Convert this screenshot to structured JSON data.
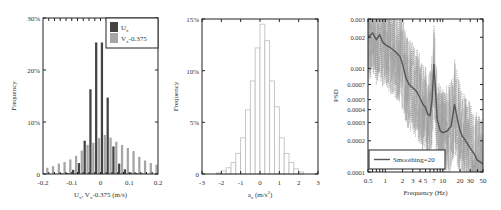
{
  "chart_data": [
    {
      "type": "bar",
      "title": "",
      "xlabel": "U_x, V_x-0.375 (m/s)",
      "ylabel": "Frequency",
      "xlim": [
        -0.2,
        0.2
      ],
      "ylim": [
        0,
        30
      ],
      "xticks": [
        "-0.2",
        "-0.1",
        "0",
        "0.1",
        "0.2"
      ],
      "yticks": [
        "0",
        "10%",
        "20%",
        "30%"
      ],
      "legend_position": "upper right",
      "bin_width": 0.02,
      "x": [
        -0.19,
        -0.17,
        -0.15,
        -0.13,
        -0.11,
        -0.09,
        -0.07,
        -0.05,
        -0.03,
        -0.01,
        0.01,
        0.03,
        0.05,
        0.07,
        0.09,
        0.11,
        0.13,
        0.15,
        0.17,
        0.19
      ],
      "series": [
        {
          "name": "U_x",
          "color": "#444444",
          "values": [
            0,
            0,
            0,
            0.1,
            0.2,
            0.8,
            2.1,
            6.4,
            16.3,
            25.3,
            25.3,
            14.7,
            5.3,
            2.0,
            0.9,
            0.3,
            0.2,
            0.1,
            0,
            0
          ]
        },
        {
          "name": "V_x-0.375",
          "color": "#a6a6a6",
          "values": [
            1.2,
            1.5,
            2.0,
            2.3,
            2.8,
            3.5,
            4.5,
            5.6,
            6.0,
            6.9,
            7.5,
            7.0,
            6.2,
            5.6,
            5.0,
            4.4,
            3.3,
            2.6,
            2.1,
            1.8
          ]
        }
      ]
    },
    {
      "type": "bar",
      "title": "",
      "xlabel": "a_x (m/s²)",
      "ylabel": "Frequency",
      "xlim": [
        -3,
        3
      ],
      "ylim": [
        0,
        15
      ],
      "xticks": [
        "-3",
        "-2",
        "-1",
        "0",
        "1",
        "2",
        "3"
      ],
      "yticks": [
        "0",
        "5%",
        "10%",
        "15%"
      ],
      "bin_width": 0.25,
      "x": [
        -2.125,
        -1.875,
        -1.625,
        -1.375,
        -1.125,
        -0.875,
        -0.625,
        -0.375,
        -0.125,
        0.125,
        0.375,
        0.625,
        0.875,
        1.125,
        1.375,
        1.625,
        1.875,
        2.125
      ],
      "series": [
        {
          "name": "a_x",
          "color": "#bbbbbb",
          "values": [
            0.1,
            0.3,
            0.6,
            1.1,
            2.0,
            3.5,
            6.2,
            9.0,
            12.2,
            14.5,
            12.9,
            9.0,
            6.5,
            3.5,
            2.0,
            1.1,
            0.5,
            0.2
          ]
        }
      ]
    },
    {
      "type": "line",
      "title": "",
      "xlabel": "Frequency (Hz)",
      "ylabel": "PSD",
      "xscale": "log",
      "yscale": "log",
      "xlim": [
        0.5,
        50
      ],
      "ylim": [
        0.0001,
        0.003
      ],
      "xticks": [
        "0.5",
        "1",
        "2",
        "3",
        "4",
        "5",
        "7",
        "10",
        "20",
        "30",
        "50"
      ],
      "yticks": [
        "0.0001",
        "0.0002",
        "0.0003",
        "0.0004",
        "0.0005",
        "0.0007",
        "0.001",
        "0.002",
        "0.003"
      ],
      "legend_position": "lower left",
      "series": [
        {
          "name": "Smoothing=20",
          "color": "#555555",
          "x": [
            0.5,
            0.6,
            0.7,
            0.8,
            0.9,
            1.0,
            1.2,
            1.4,
            1.6,
            1.8,
            2.0,
            2.3,
            2.6,
            3.0,
            3.5,
            4.0,
            4.5,
            5.0,
            5.5,
            6.0,
            6.5,
            7.0,
            7.5,
            8.0,
            9.0,
            10,
            12,
            14,
            16,
            18,
            20,
            22,
            25,
            30,
            35,
            40,
            50
          ],
          "y": [
            0.002,
            0.0022,
            0.0019,
            0.0021,
            0.0018,
            0.0017,
            0.0016,
            0.0015,
            0.0014,
            0.0013,
            0.0011,
            0.0008,
            0.0007,
            0.00065,
            0.0006,
            0.00052,
            0.00045,
            0.00042,
            0.00036,
            0.00035,
            0.0005,
            0.0011,
            0.0006,
            0.00032,
            0.00025,
            0.00024,
            0.00025,
            0.00028,
            0.00045,
            0.00032,
            0.00025,
            0.00022,
            0.0002,
            0.00017,
            0.00015,
            0.00013,
            0.00012
          ]
        },
        {
          "name": "raw PSD (dotted)",
          "color": "#999999"
        }
      ]
    }
  ]
}
